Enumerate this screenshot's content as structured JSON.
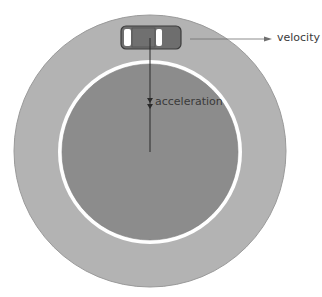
{
  "diagram": {
    "type": "circular-motion",
    "labels": {
      "velocity": "velocity",
      "acceleration": "acceleration"
    },
    "colors": {
      "outer_track": "#b3b3b3",
      "inner_field": "#8c8c8c",
      "ring": "#ffffff",
      "arrow": "#555555",
      "car_body": "#6e6e6e",
      "car_window": "#ffffff"
    }
  }
}
